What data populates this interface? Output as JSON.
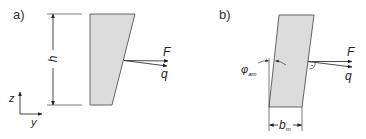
{
  "figure": {
    "panels": [
      {
        "id": "a",
        "label": "a)",
        "dimension_label": "h",
        "force_label": "F",
        "load_label": "q",
        "axes": {
          "vertical": "z",
          "horizontal": "y"
        }
      },
      {
        "id": "b",
        "label": "b)",
        "angle_symbol": "φ",
        "angle_subscript": "am",
        "width_symbol": "b",
        "width_subscript": "m",
        "force_label": "F",
        "load_label": "q"
      }
    ],
    "colors": {
      "fill": "#dcdcdc",
      "stroke": "#333333",
      "background": "#ffffff"
    }
  }
}
